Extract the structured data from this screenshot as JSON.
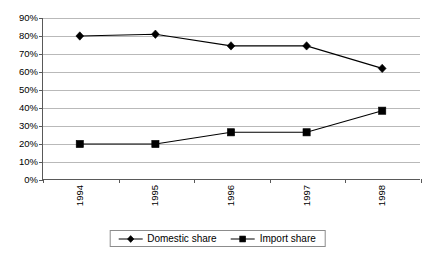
{
  "chart_data": {
    "type": "line",
    "title": "",
    "subtitle": "",
    "xlabel": "",
    "ylabel": "",
    "categories": [
      "1994",
      "1995",
      "1996",
      "1997",
      "1998"
    ],
    "series": [
      {
        "name": "Domestic share",
        "marker": "diamond",
        "color": "#000000",
        "values": [
          80,
          81,
          74.5,
          74.5,
          62
        ]
      },
      {
        "name": "Import share",
        "marker": "square",
        "color": "#000000",
        "values": [
          20,
          20,
          26.5,
          26.5,
          38.5
        ]
      }
    ],
    "ylim": [
      0,
      90
    ],
    "ytick_step": 10,
    "ytick_labels": [
      "0%",
      "10%",
      "20%",
      "30%",
      "40%",
      "50%",
      "60%",
      "70%",
      "80%",
      "90%"
    ],
    "ytick_values": [
      0,
      10,
      20,
      30,
      40,
      50,
      60,
      70,
      80,
      90
    ],
    "grid": {
      "horizontal": true,
      "vertical": false,
      "color": "#b9b9b9"
    },
    "legend": {
      "position": "bottom",
      "border": true,
      "entries": [
        "Domestic share",
        "Import share"
      ]
    },
    "xtick_label_rotation": -90,
    "axis_color": "#595959",
    "plot_background": "#ffffff"
  }
}
